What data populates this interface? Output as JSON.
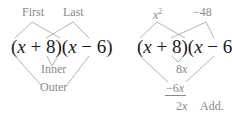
{
  "left_diagram": {
    "expression": {
      "open1": "(",
      "var1": "x",
      "mid1": " + 8)(",
      "var2": "x",
      "mid2": " − 6)"
    },
    "labels": {
      "first": "First",
      "last": "Last",
      "inner": "Inner",
      "outer": "Outer"
    }
  },
  "right_diagram": {
    "expression": {
      "open1": "(",
      "var1": "x",
      "mid1": " + 8)(",
      "var2": "x",
      "mid2": " − 6)"
    },
    "products": {
      "first_var": "x",
      "first_exp": "2",
      "last": "−48",
      "inner_coef": "8",
      "inner_var": "x",
      "outer_coef": "−6",
      "outer_var": "x",
      "sum_coef": "2",
      "sum_var": "x",
      "add_note": "Add."
    }
  },
  "colors": {
    "expression_text": "#1a1a1a",
    "label_text": "#8a8a8a",
    "lines": "#9a9a9a"
  }
}
